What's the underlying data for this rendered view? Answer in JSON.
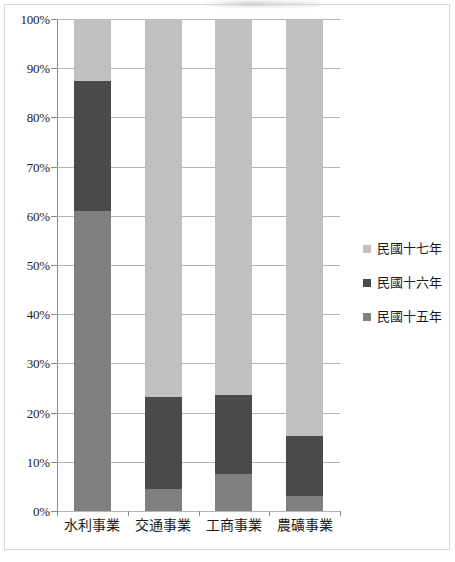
{
  "chart_data": {
    "type": "bar",
    "subtype": "stacked-100-percent",
    "title": "",
    "xlabel": "",
    "ylabel": "",
    "ylim": [
      0,
      100
    ],
    "grid": true,
    "legend_position": "right",
    "categories": [
      "水利事業",
      "交通事業",
      "工商事業",
      "農礦事業"
    ],
    "ytick_labels": [
      "100%",
      "90%",
      "80%",
      "70%",
      "60%",
      "50%",
      "40%",
      "30%",
      "20%",
      "10%",
      "0%"
    ],
    "ytick_values": [
      100,
      90,
      80,
      70,
      60,
      50,
      40,
      30,
      20,
      10,
      0
    ],
    "series": [
      {
        "name": "民國十五年",
        "color": "#808080",
        "values": [
          61.0,
          4.5,
          7.5,
          3.0
        ]
      },
      {
        "name": "民國十六年",
        "color": "#4a4a4a",
        "values": [
          26.4,
          18.7,
          16.1,
          12.2
        ]
      },
      {
        "name": "民國十七年",
        "color": "#c0c0c0",
        "values": [
          12.6,
          76.8,
          76.4,
          84.8
        ]
      }
    ],
    "stack_tops": {
      "民國十五年": [
        61.0,
        4.5,
        7.5,
        3.0
      ],
      "民國十六年": [
        87.4,
        23.2,
        23.6,
        15.2
      ],
      "民國十七年": [
        100,
        100,
        100,
        100
      ]
    }
  },
  "legend": {
    "items": [
      {
        "label": "民國十七年",
        "color": "#c0c0c0"
      },
      {
        "label": "民國十六年",
        "color": "#4a4a4a"
      },
      {
        "label": "民國十五年",
        "color": "#808080"
      }
    ]
  },
  "axis": {
    "y_labels": [
      "100%",
      "90%",
      "80%",
      "70%",
      "60%",
      "50%",
      "40%",
      "30%",
      "20%",
      "10%",
      "0%"
    ],
    "x_labels": [
      "水利事業",
      "交通事業",
      "工商事業",
      "農礦事業"
    ]
  }
}
